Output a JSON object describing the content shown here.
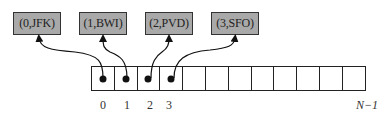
{
  "diagram": {
    "entries": [
      {
        "label": "(0,JFK)",
        "key": 0,
        "value": "JFK"
      },
      {
        "label": "(1,BWI)",
        "key": 1,
        "value": "BWI"
      },
      {
        "label": "(2,PVD)",
        "key": 2,
        "value": "PVD"
      },
      {
        "label": "(3,SFO)",
        "key": 3,
        "value": "SFO"
      }
    ],
    "array": {
      "cell_count": 12,
      "filled_cells": [
        0,
        1,
        2,
        3
      ],
      "index_labels": [
        "0",
        "1",
        "2",
        "3"
      ],
      "last_index_label": "N−1"
    },
    "colors": {
      "entry_fill": "#a9a9a9",
      "entry_border": "#333333",
      "cell_border": "#222222",
      "arrow": "#111111"
    }
  }
}
